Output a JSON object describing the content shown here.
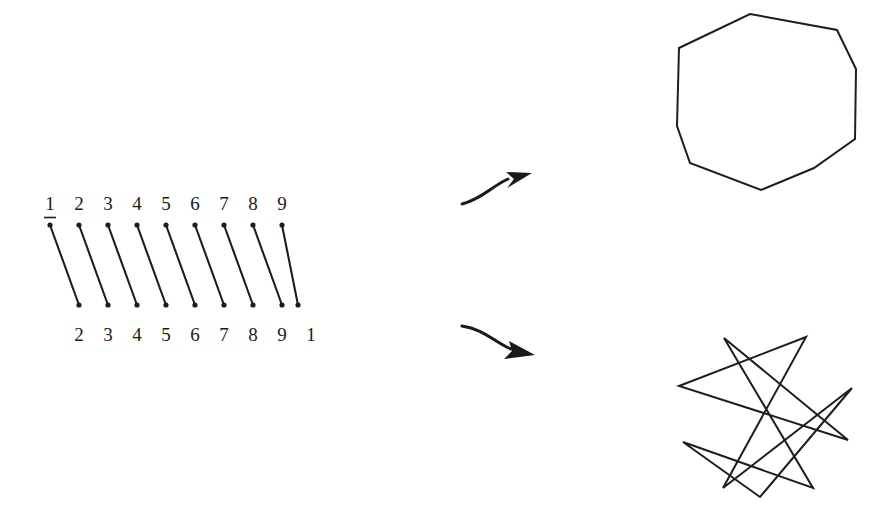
{
  "figure": {
    "background_color": "#ffffff",
    "ink_color": "#201d1c",
    "width": 894,
    "height": 517
  },
  "permutation_table": {
    "name": "two-line permutation notation",
    "top_row_label": "domain",
    "bottom_row_label": "image",
    "top_row": [
      "1",
      "2",
      "3",
      "4",
      "5",
      "6",
      "7",
      "8",
      "9"
    ],
    "bottom_row": [
      "2",
      "3",
      "4",
      "5",
      "6",
      "7",
      "8",
      "9",
      "1"
    ],
    "arrow_count": 9,
    "column_x": [
      50,
      79,
      108,
      137,
      166,
      195,
      224,
      253,
      282
    ],
    "top_label_y": 210,
    "bottom_label_y": 341,
    "arrow_top_y": 224,
    "arrow_bottom_y": 306,
    "arrow_dx": 29,
    "has_overline_on_first": true
  },
  "map_arrows": [
    {
      "name": "arrow-to-nonagon",
      "start_x": 462,
      "start_y": 203,
      "end_x": 530,
      "end_y": 175,
      "direction": "up-right"
    },
    {
      "name": "arrow-to-star",
      "start_x": 462,
      "start_y": 327,
      "end_x": 533,
      "end_y": 353,
      "direction": "down-right"
    }
  ],
  "shapes": [
    {
      "name": "nonagon",
      "label": "regular nonagon {9}",
      "sides": 9,
      "schlafli": "{9/1}",
      "center_x": 766,
      "center_y": 106,
      "radius": 92,
      "start_angle_deg": -100,
      "vertices": [
        [
          750,
          14
        ],
        [
          837,
          30
        ],
        [
          856,
          69
        ],
        [
          855,
          139
        ],
        [
          814,
          168
        ],
        [
          761,
          190
        ],
        [
          690,
          163
        ],
        [
          677,
          126
        ],
        [
          679,
          48
        ]
      ]
    },
    {
      "name": "star-polygon",
      "label": "star polygon {9/2}",
      "sides": 9,
      "step": 2,
      "schlafli": "{9/2}",
      "center_x": 765,
      "center_y": 415,
      "radius": 80,
      "start_angle_deg": -100,
      "vertices": [
        [
          724,
          338
        ],
        [
          806,
          337
        ],
        [
          852,
          388
        ],
        [
          848,
          440
        ],
        [
          813,
          488
        ],
        [
          760,
          497
        ],
        [
          723,
          488
        ],
        [
          683,
          442
        ],
        [
          679,
          386
        ]
      ]
    }
  ],
  "colors": {
    "ink": "#201d1c",
    "paper": "#ffffff",
    "label_text": "#1a1a1a"
  }
}
